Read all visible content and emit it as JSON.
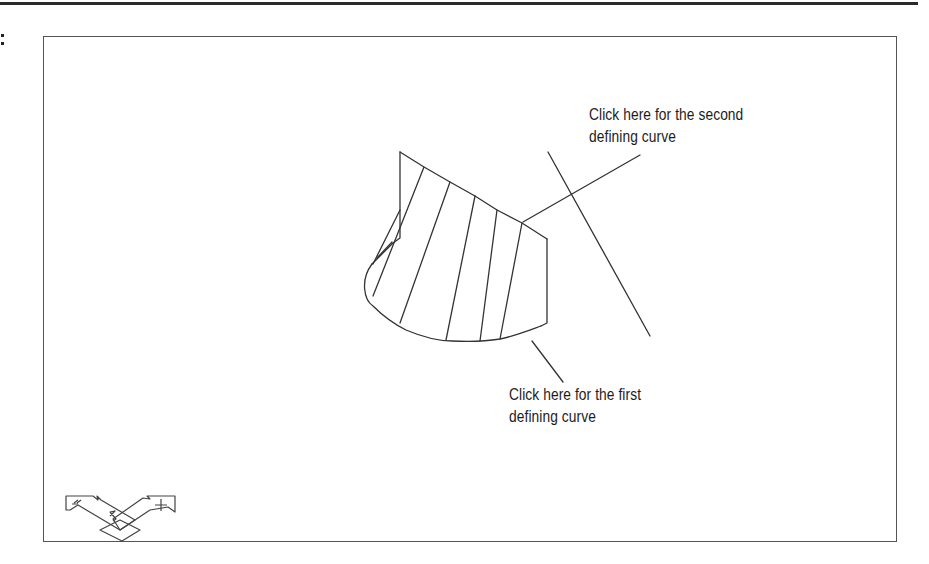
{
  "figure": {
    "prefix_text": ":",
    "callouts": {
      "second_curve": {
        "line1": "Click here for the second",
        "line2": "defining curve"
      },
      "first_curve": {
        "line1": "Click here for the first",
        "line2": "defining curve"
      }
    },
    "ucs_icon": {
      "x_label": "X",
      "y_label": "Y",
      "z_label": "Z"
    },
    "colors": {
      "line": "#333333",
      "frame": "#555555",
      "text": "#1c1c1c"
    }
  }
}
